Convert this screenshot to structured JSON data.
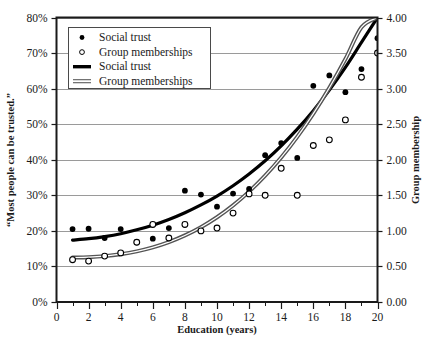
{
  "chart_data": {
    "type": "scatter",
    "title": "",
    "xlabel": "Education (years)",
    "ylabel": "“Most people can be trusted.”",
    "y2label": "Group membership",
    "xlim": [
      0,
      20
    ],
    "ylim": [
      0,
      0.8
    ],
    "y2lim": [
      0.0,
      4.0
    ],
    "grid": true,
    "legend_position": "top-left-inside",
    "xticks": [
      0,
      2,
      4,
      6,
      8,
      10,
      12,
      14,
      16,
      18,
      20
    ],
    "xtick_labels": [
      "0",
      "2",
      "4",
      "6",
      "8",
      "10",
      "12",
      "14",
      "16",
      "18",
      "20"
    ],
    "xminorticks": [
      1,
      3,
      5,
      7,
      9,
      11,
      13,
      15,
      17,
      19
    ],
    "yticks": [
      0,
      0.1,
      0.2,
      0.3,
      0.4,
      0.5,
      0.6,
      0.7,
      0.8
    ],
    "ytick_labels": [
      "0%",
      "10%",
      "20%",
      "30%",
      "40%",
      "50%",
      "60%",
      "70%",
      "80%"
    ],
    "y2ticks": [
      0.0,
      0.5,
      1.0,
      1.5,
      2.0,
      2.5,
      3.0,
      3.5,
      4.0
    ],
    "y2tick_labels": [
      "0.00",
      "0.50",
      "1.00",
      "1.50",
      "2.00",
      "2.50",
      "3.00",
      "3.50",
      "4.00"
    ],
    "series": [
      {
        "name": "Social trust",
        "kind": "scatter",
        "marker": "filled-circle",
        "axis": "left",
        "color": "#000000",
        "x": [
          1,
          2,
          3,
          4,
          5,
          6,
          7,
          8,
          9,
          10,
          11,
          12,
          13,
          14,
          15,
          16,
          17,
          18,
          19,
          20
        ],
        "y": [
          0.205,
          0.206,
          0.18,
          0.205,
          0.168,
          0.178,
          0.208,
          0.313,
          0.302,
          0.268,
          0.305,
          0.318,
          0.413,
          0.447,
          0.405,
          0.608,
          0.637,
          0.59,
          0.655,
          0.742
        ]
      },
      {
        "name": "Group memberships",
        "kind": "scatter",
        "marker": "open-circle",
        "axis": "right",
        "color": "#000000",
        "x": [
          1,
          2,
          3,
          4,
          5,
          6,
          7,
          8,
          9,
          10,
          11,
          12,
          13,
          14,
          15,
          16,
          17,
          18,
          19,
          20
        ],
        "y": [
          0.595,
          0.575,
          0.645,
          0.69,
          0.84,
          1.09,
          0.9,
          1.09,
          1.0,
          1.04,
          1.25,
          1.52,
          1.5,
          1.88,
          1.5,
          2.2,
          2.28,
          2.56,
          3.16,
          3.5
        ]
      },
      {
        "name": "Social trust",
        "kind": "fit-line",
        "axis": "left",
        "color": "#000000",
        "linewidth": 3.2,
        "x": [
          1,
          2,
          3,
          4,
          5,
          6,
          7,
          8,
          9,
          10,
          11,
          12,
          13,
          14,
          15,
          16,
          17,
          18,
          19,
          20
        ],
        "y": [
          0.174,
          0.178,
          0.184,
          0.192,
          0.203,
          0.216,
          0.232,
          0.251,
          0.273,
          0.298,
          0.327,
          0.36,
          0.397,
          0.439,
          0.486,
          0.538,
          0.596,
          0.66,
          0.73,
          0.8
        ]
      },
      {
        "name": "Group memberships",
        "kind": "fit-line",
        "axis": "right",
        "color": "#555555",
        "linewidth": 2.0,
        "double": true,
        "x": [
          1,
          2,
          3,
          4,
          5,
          6,
          7,
          8,
          9,
          10,
          11,
          12,
          13,
          14,
          15,
          16,
          17,
          18,
          19,
          20
        ],
        "y": [
          0.625,
          0.63,
          0.645,
          0.672,
          0.712,
          0.768,
          0.842,
          0.936,
          1.052,
          1.192,
          1.358,
          1.552,
          1.776,
          2.032,
          2.322,
          2.648,
          3.012,
          3.416,
          3.862,
          4.0
        ]
      }
    ],
    "legend_entries": [
      {
        "label": "Social trust",
        "symbol": "filled-circle"
      },
      {
        "label": "Group memberships",
        "symbol": "open-circle"
      },
      {
        "label": "Social trust",
        "symbol": "thick-line"
      },
      {
        "label": "Group memberships",
        "symbol": "double-line"
      }
    ],
    "colors": {
      "axis": "#1a1a1a",
      "grid": "#9a9a9a",
      "marker": "#000000",
      "trust_line": "#000000",
      "group_line": "#5a5a5a",
      "background": "#ffffff"
    }
  }
}
